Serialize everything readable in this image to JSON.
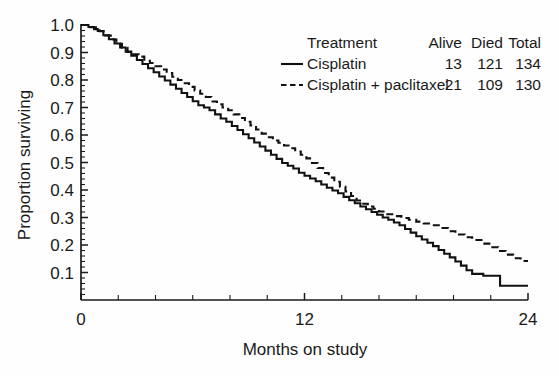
{
  "chart_data": {
    "type": "line",
    "title": "",
    "xlabel": "Months on study",
    "ylabel": "Proportion surviving",
    "xlim": [
      0,
      24
    ],
    "ylim": [
      0,
      1.0
    ],
    "grid": false,
    "legend_position": "top-right",
    "x_ticks_major": [
      0,
      12,
      24
    ],
    "x_tick_labels": [
      "0",
      "12",
      "24"
    ],
    "x_ticks_minor_step": 2,
    "y_ticks_major": [
      0.1,
      0.2,
      0.3,
      0.4,
      0.5,
      0.6,
      0.7,
      0.8,
      0.9,
      1.0
    ],
    "y_tick_labels": [
      "0.1",
      "0.2",
      "0.3",
      "0.4",
      "0.5",
      "0.6",
      "0.7",
      "0.8",
      "0.9",
      "1.0"
    ],
    "y_ticks_minor_step": 0.02,
    "curve_style": "step-post",
    "series": [
      {
        "name": "Cisplatin",
        "style": "solid",
        "color": "#111111",
        "alive": 13,
        "died": 121,
        "total": 134,
        "points": [
          [
            0.0,
            1.0
          ],
          [
            0.4,
            0.993
          ],
          [
            0.7,
            0.985
          ],
          [
            0.9,
            0.978
          ],
          [
            1.2,
            0.963
          ],
          [
            1.5,
            0.948
          ],
          [
            1.8,
            0.933
          ],
          [
            2.1,
            0.918
          ],
          [
            2.4,
            0.903
          ],
          [
            2.7,
            0.888
          ],
          [
            3.0,
            0.873
          ],
          [
            3.3,
            0.858
          ],
          [
            3.6,
            0.843
          ],
          [
            3.9,
            0.828
          ],
          [
            4.2,
            0.813
          ],
          [
            4.5,
            0.798
          ],
          [
            4.8,
            0.783
          ],
          [
            5.1,
            0.768
          ],
          [
            5.4,
            0.753
          ],
          [
            5.7,
            0.738
          ],
          [
            6.0,
            0.723
          ],
          [
            6.3,
            0.708
          ],
          [
            6.6,
            0.7
          ],
          [
            6.9,
            0.69
          ],
          [
            7.2,
            0.675
          ],
          [
            7.5,
            0.66
          ],
          [
            7.8,
            0.648
          ],
          [
            8.1,
            0.633
          ],
          [
            8.4,
            0.618
          ],
          [
            8.7,
            0.603
          ],
          [
            9.0,
            0.588
          ],
          [
            9.3,
            0.573
          ],
          [
            9.6,
            0.558
          ],
          [
            9.9,
            0.543
          ],
          [
            10.2,
            0.528
          ],
          [
            10.5,
            0.513
          ],
          [
            10.8,
            0.498
          ],
          [
            11.1,
            0.488
          ],
          [
            11.4,
            0.478
          ],
          [
            11.7,
            0.463
          ],
          [
            12.0,
            0.452
          ],
          [
            12.3,
            0.442
          ],
          [
            12.6,
            0.432
          ],
          [
            12.9,
            0.42
          ],
          [
            13.2,
            0.408
          ],
          [
            13.5,
            0.398
          ],
          [
            13.8,
            0.388
          ],
          [
            14.1,
            0.375
          ],
          [
            14.4,
            0.363
          ],
          [
            14.7,
            0.352
          ],
          [
            15.0,
            0.34
          ],
          [
            15.3,
            0.33
          ],
          [
            15.6,
            0.32
          ],
          [
            15.9,
            0.31
          ],
          [
            16.2,
            0.3
          ],
          [
            16.5,
            0.292
          ],
          [
            16.8,
            0.282
          ],
          [
            17.1,
            0.272
          ],
          [
            17.4,
            0.258
          ],
          [
            17.7,
            0.245
          ],
          [
            18.0,
            0.232
          ],
          [
            18.3,
            0.22
          ],
          [
            18.6,
            0.208
          ],
          [
            18.9,
            0.196
          ],
          [
            19.2,
            0.182
          ],
          [
            19.5,
            0.168
          ],
          [
            19.8,
            0.155
          ],
          [
            20.1,
            0.14
          ],
          [
            20.4,
            0.125
          ],
          [
            20.7,
            0.108
          ],
          [
            21.0,
            0.095
          ],
          [
            21.6,
            0.088
          ],
          [
            22.3,
            0.088
          ],
          [
            22.5,
            0.052
          ],
          [
            24.0,
            0.052
          ]
        ]
      },
      {
        "name": "Cisplatin + paclitaxel",
        "style": "dashed",
        "color": "#111111",
        "alive": 21,
        "died": 109,
        "total": 130,
        "points": [
          [
            0.0,
            1.0
          ],
          [
            0.5,
            0.992
          ],
          [
            0.8,
            0.985
          ],
          [
            1.0,
            0.977
          ],
          [
            1.3,
            0.962
          ],
          [
            1.6,
            0.947
          ],
          [
            1.9,
            0.932
          ],
          [
            2.2,
            0.917
          ],
          [
            2.5,
            0.902
          ],
          [
            2.8,
            0.893
          ],
          [
            3.1,
            0.885
          ],
          [
            3.4,
            0.87
          ],
          [
            3.7,
            0.862
          ],
          [
            4.0,
            0.85
          ],
          [
            4.3,
            0.838
          ],
          [
            4.6,
            0.825
          ],
          [
            4.9,
            0.812
          ],
          [
            5.2,
            0.8
          ],
          [
            5.5,
            0.788
          ],
          [
            5.8,
            0.775
          ],
          [
            6.1,
            0.762
          ],
          [
            6.4,
            0.75
          ],
          [
            6.7,
            0.738
          ],
          [
            7.0,
            0.722
          ],
          [
            7.3,
            0.712
          ],
          [
            7.6,
            0.7
          ],
          [
            7.9,
            0.69
          ],
          [
            8.2,
            0.675
          ],
          [
            8.5,
            0.662
          ],
          [
            8.8,
            0.648
          ],
          [
            9.1,
            0.635
          ],
          [
            9.4,
            0.62
          ],
          [
            9.7,
            0.605
          ],
          [
            10.0,
            0.592
          ],
          [
            10.3,
            0.58
          ],
          [
            10.6,
            0.572
          ],
          [
            10.9,
            0.562
          ],
          [
            11.2,
            0.552
          ],
          [
            11.5,
            0.54
          ],
          [
            11.8,
            0.528
          ],
          [
            12.1,
            0.515
          ],
          [
            12.4,
            0.498
          ],
          [
            12.7,
            0.48
          ],
          [
            13.0,
            0.462
          ],
          [
            13.3,
            0.445
          ],
          [
            13.6,
            0.43
          ],
          [
            13.9,
            0.412
          ],
          [
            14.2,
            0.395
          ],
          [
            14.5,
            0.378
          ],
          [
            14.8,
            0.362
          ],
          [
            15.1,
            0.35
          ],
          [
            15.4,
            0.34
          ],
          [
            15.7,
            0.332
          ],
          [
            16.0,
            0.322
          ],
          [
            16.3,
            0.312
          ],
          [
            16.8,
            0.305
          ],
          [
            17.2,
            0.298
          ],
          [
            17.6,
            0.292
          ],
          [
            18.0,
            0.285
          ],
          [
            18.4,
            0.278
          ],
          [
            18.8,
            0.272
          ],
          [
            19.3,
            0.262
          ],
          [
            19.7,
            0.25
          ],
          [
            20.1,
            0.238
          ],
          [
            20.6,
            0.228
          ],
          [
            21.0,
            0.218
          ],
          [
            21.5,
            0.205
          ],
          [
            22.0,
            0.192
          ],
          [
            22.4,
            0.178
          ],
          [
            22.8,
            0.165
          ],
          [
            23.2,
            0.152
          ],
          [
            23.6,
            0.142
          ],
          [
            24.0,
            0.142
          ]
        ]
      }
    ],
    "legend": {
      "header_name": "Treatment",
      "columns": [
        "Alive",
        "Died",
        "Total"
      ],
      "rows": [
        {
          "label": "Cisplatin",
          "style": "solid",
          "values": [
            "13",
            "121",
            "134"
          ]
        },
        {
          "label": "Cisplatin + paclitaxel",
          "style": "dashed",
          "values": [
            "21",
            "109",
            "130"
          ]
        }
      ]
    }
  }
}
